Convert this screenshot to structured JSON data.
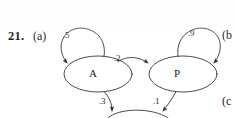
{
  "figure": {
    "problem_number": "21.",
    "part_a_label": "(a)",
    "part_b_label": "(b",
    "part_c_label": "(c",
    "background_color": "#ffffff",
    "ink_color": "#2b2b2b"
  },
  "diagram": {
    "type": "markov-chain-state-diagram",
    "nodes": [
      {
        "id": "A",
        "label": "A",
        "cx": 98,
        "cy": 74,
        "rx": 34,
        "ry": 18
      },
      {
        "id": "P",
        "label": "P",
        "cx": 183,
        "cy": 74,
        "rx": 34,
        "ry": 18
      }
    ],
    "edges": [
      {
        "from": "A",
        "to": "A",
        "label": ".5",
        "kind": "self-loop",
        "side": "top-left"
      },
      {
        "from": "A",
        "to": "P",
        "label": ".2",
        "kind": "arc",
        "side": "top"
      },
      {
        "from": "P",
        "to": "P",
        "label": ".9",
        "kind": "self-loop",
        "side": "top-right"
      },
      {
        "from": "A",
        "to": "offscreen-below",
        "label": ".3",
        "kind": "arc",
        "side": "bottom-left"
      },
      {
        "from": "P",
        "to": "offscreen-below",
        "label": ".1",
        "kind": "arc",
        "side": "bottom-right"
      }
    ]
  }
}
